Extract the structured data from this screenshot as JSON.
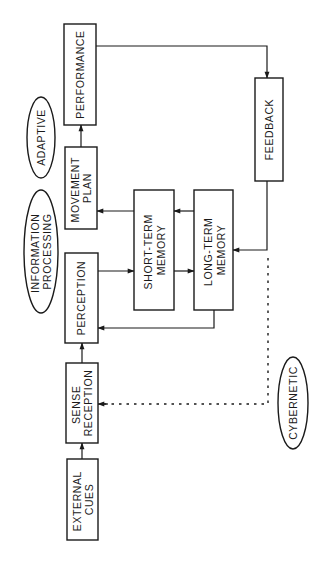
{
  "diagram": {
    "title": "",
    "nodes": {
      "external_cues": {
        "lines": [
          "EXTERNAL",
          "CUES"
        ]
      },
      "sense_reception": {
        "lines": [
          "SENSE",
          "RECEPTION"
        ]
      },
      "perception": {
        "lines": [
          "PERCEPTION"
        ]
      },
      "short_term_memory": {
        "lines": [
          "SHORT-TERM",
          "MEMORY"
        ]
      },
      "long_term_memory": {
        "lines": [
          "LONG-TERM",
          "MEMORY"
        ]
      },
      "movement_plan": {
        "lines": [
          "MOVEMENT",
          "PLAN"
        ]
      },
      "performance": {
        "lines": [
          "PERFORMANCE"
        ]
      },
      "feedback": {
        "lines": [
          "FEEDBACK"
        ]
      }
    },
    "labels": {
      "adaptive": {
        "lines": [
          "ADAPTIVE"
        ]
      },
      "information_processing": {
        "lines": [
          "INFORMATION",
          "PROCESSING"
        ]
      },
      "cybernetic": {
        "lines": [
          "CYBERNETIC"
        ]
      }
    },
    "edges": [
      {
        "from": "External Cues",
        "to": "Sense Reception",
        "style": "solid"
      },
      {
        "from": "Sense Reception",
        "to": "Perception",
        "style": "solid"
      },
      {
        "from": "Perception",
        "to": "Short-Term Memory",
        "style": "solid"
      },
      {
        "from": "Short-Term Memory",
        "to": "Long-Term Memory",
        "style": "solid"
      },
      {
        "from": "Long-Term Memory",
        "to": "Short-Term Memory",
        "style": "solid"
      },
      {
        "from": "Long-Term Memory",
        "to": "Perception",
        "style": "solid"
      },
      {
        "from": "Short-Term Memory",
        "to": "Movement Plan",
        "style": "solid"
      },
      {
        "from": "Movement Plan",
        "to": "Performance",
        "style": "solid"
      },
      {
        "from": "Performance",
        "to": "Feedback",
        "style": "solid"
      },
      {
        "from": "Feedback",
        "to": "Long-Term Memory",
        "style": "solid"
      },
      {
        "from": "Feedback",
        "to": "Sense Reception",
        "style": "dotted"
      }
    ]
  }
}
